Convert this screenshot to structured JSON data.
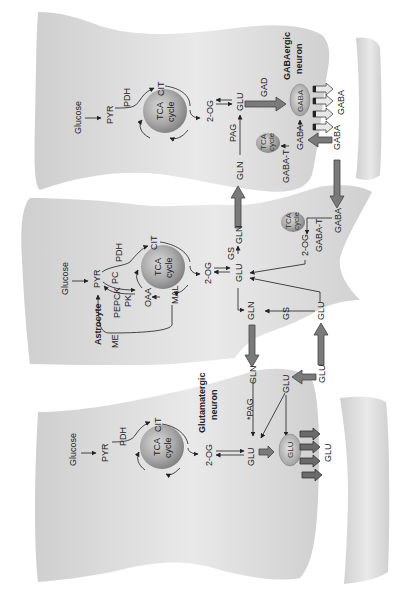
{
  "figure": {
    "orientation": "rotated-90-ccw",
    "colors": {
      "cell_fill": "#d4d4d4",
      "cell_fill_light": "#eeeeee",
      "tca_fill": "#9a9a9a",
      "arrow_fill": "#7a7a7a",
      "text": "#222222"
    }
  },
  "gabaergic": {
    "title_line1": "GABAergic",
    "title_line2": "neuron",
    "glucose": "Glucose",
    "pyr": "PYR",
    "pdh": "PDH",
    "cit": "CIT",
    "tca_line1": "TCA",
    "tca_line2": "cycle",
    "og": "2-OG",
    "glu": "GLU",
    "gad": "GAD",
    "gaba_vesicle": "GABA",
    "gaba_release": "GABA",
    "pag": "PAG",
    "gln": "GLN",
    "tca_small_line1": "TCA",
    "tca_small_line2": "cycle",
    "gaba_t": "GABA-T",
    "gaba_inner": "GABA",
    "gaba_uptake": "GABA"
  },
  "astrocyte": {
    "title": "Astrocyte",
    "glucose": "Glucose",
    "pyr": "PYR",
    "pdh": "PDH",
    "pc": "PC",
    "pepck": "PEPCK",
    "pk": "PK",
    "me": "ME",
    "oaa": "OAA",
    "mal": "MAL",
    "cit": "CIT",
    "tca_line1": "TCA",
    "tca_line2": "cycle",
    "og": "2-OG",
    "glu": "GLU",
    "gs_top": "GS",
    "gln_top": "GLN",
    "tca_small_line1": "TCA",
    "tca_small_line2": "cycle",
    "og_small": "2-OG",
    "gaba_t": "GABA-T",
    "gaba": "GABA",
    "gln_bottom": "GLN",
    "gs_bottom": "GS",
    "glu_bottom": "GLU",
    "glu_uptake": "GLU"
  },
  "glutamatergic": {
    "title_line1": "Glutamatergic",
    "title_line2": "neuron",
    "glucose": "Glucose",
    "pyr": "PYR",
    "pdh": "PDH",
    "cit": "CIT",
    "tca_line1": "TCA",
    "tca_line2": "cycle",
    "og": "2-OG",
    "glu": "GLU",
    "pag": "*PAG",
    "gln": "GLN",
    "glu_reuptake": "GLU",
    "glu_vesicle": "GLU",
    "glu_release": "GLU"
  }
}
